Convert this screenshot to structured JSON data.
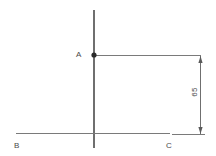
{
  "diagram": {
    "stroke_color": "#6f6f6f",
    "text_color": "#4a4a4a",
    "background_color": "#ffffff",
    "points": [
      {
        "id": "A",
        "label": "A",
        "x": 94,
        "y": 55,
        "marker": "filled-dot"
      },
      {
        "id": "B",
        "label": "B",
        "x": 16,
        "y": 133,
        "marker": "none"
      },
      {
        "id": "C",
        "label": "C",
        "x": 170,
        "y": 133,
        "marker": "none"
      }
    ],
    "lines": [
      {
        "name": "vertical-axis",
        "x1": 94,
        "y1": 10,
        "x2": 94,
        "y2": 148
      },
      {
        "name": "baseline-BC",
        "x1": 16,
        "y1": 133,
        "x2": 170,
        "y2": 133
      },
      {
        "name": "extension-from-A",
        "x1": 94,
        "y1": 55,
        "x2": 201,
        "y2": 55
      },
      {
        "name": "extension-from-C",
        "x1": 172,
        "y1": 134,
        "x2": 205,
        "y2": 134
      }
    ],
    "dimension": {
      "name": "vertical-dimension-65",
      "value": "65",
      "x": 200,
      "y_top": 55,
      "y_bottom": 134,
      "arrow_style": "double-ended"
    }
  }
}
